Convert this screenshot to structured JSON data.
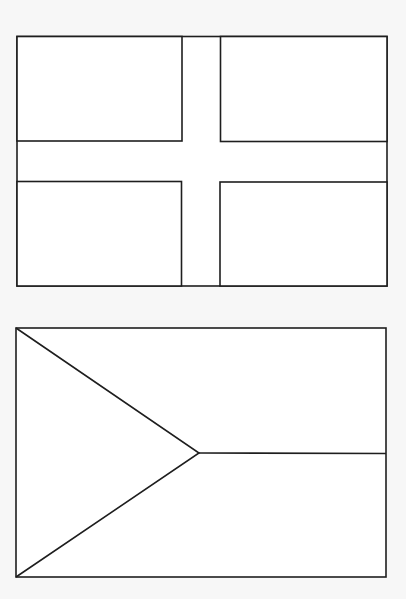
{
  "page": {
    "type": "coloring-page",
    "background": "#f7f7f7",
    "line_color": "#1e1e1e"
  },
  "flags": [
    {
      "id": "nordic-cross-flag",
      "kind": "nordic-cross",
      "bounds": {
        "x": 17,
        "y": 36,
        "w": 370,
        "h": 250
      },
      "cross": {
        "v_x1": 182,
        "v_x2": 220,
        "h_y1": 141,
        "h_y2": 182
      }
    },
    {
      "id": "triangle-hoist-flag",
      "kind": "triangle-hoist-bicolor",
      "bounds": {
        "x": 16,
        "y": 328,
        "w": 370,
        "h": 249
      },
      "apex": {
        "x": 199,
        "y": 453
      }
    }
  ]
}
